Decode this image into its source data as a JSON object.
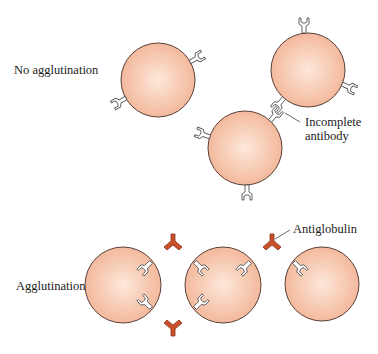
{
  "figure": {
    "labels": {
      "no_agglutination": "No agglutination",
      "agglutination": "Agglutination",
      "incomplete_antibody_line1": "Incomplete",
      "incomplete_antibody_line2": "antibody",
      "antiglobulin": "Antiglobulin"
    },
    "colors": {
      "cell_fill_center": "#fde8da",
      "cell_fill_edge": "#f2b496",
      "cell_outline": "#5a4038",
      "antibody_fill": "#ffffff",
      "antiglobulin_fill": "#c8502a"
    },
    "panels": [
      {
        "name": "no-agglutination",
        "cell_count": 3,
        "description": "Red cells coated with incomplete antibody, not linked"
      },
      {
        "name": "agglutination",
        "cell_count": 3,
        "description": "Antiglobulin bridges incomplete antibodies on adjacent cells"
      }
    ]
  }
}
